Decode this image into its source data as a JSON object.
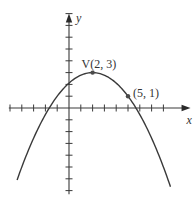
{
  "chart_data": {
    "type": "line",
    "title": "",
    "xlabel": "x",
    "ylabel": "y",
    "function": "y = -(2/9)(x - 2)^2 + 3",
    "vertex": {
      "label": "V(2, 3)",
      "x": 2,
      "y": 3
    },
    "points": [
      {
        "label": "V(2, 3)",
        "x": 2,
        "y": 3
      },
      {
        "label": "(5, 1)",
        "x": 5,
        "y": 1
      }
    ],
    "x_ticks": [
      -5,
      -4,
      -3,
      -2,
      -1,
      1,
      2,
      3,
      4,
      5,
      6,
      7,
      8
    ],
    "y_ticks": [
      -7,
      -6,
      -5,
      -4,
      -3,
      -2,
      -1,
      1,
      2,
      3,
      4,
      5,
      6,
      7,
      8
    ],
    "xlim": [
      -5.1,
      10.3
    ],
    "ylim": [
      -7.3,
      8
    ],
    "curve_x_range": [
      -4.4,
      8.6
    ],
    "grid": false,
    "colors": {
      "axis": "#3a3a3a",
      "curve": "#3a3a3a",
      "point": "#4a4a4a"
    }
  },
  "labels": {
    "x_axis": "x",
    "y_axis": "y",
    "vertex": "V(2, 3)",
    "point": "(5, 1)"
  },
  "layout": {
    "origin_px": [
      69,
      108
    ],
    "unit_px": 11.8
  }
}
